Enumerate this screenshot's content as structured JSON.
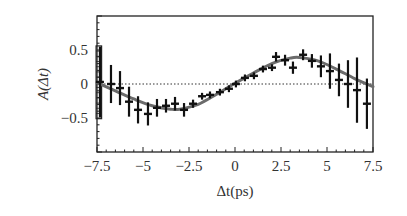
{
  "chart_data": {
    "type": "scatter",
    "title": "",
    "xlabel": "Δt(ps)",
    "ylabel": "A(Δt)",
    "xlim": [
      -7.5,
      7.5
    ],
    "ylim": [
      -1.0,
      1.0
    ],
    "x_ticks": [
      -7.5,
      -5,
      -2.5,
      0,
      2.5,
      5,
      7.5
    ],
    "x_tick_labels": [
      "−7.5",
      "−5",
      "−2.5",
      "0",
      "2.5",
      "5",
      "7.5"
    ],
    "y_ticks": [
      0.5,
      0,
      -0.5
    ],
    "y_tick_labels": [
      "0.5",
      "0",
      "−0.5"
    ],
    "grid": false,
    "legend": null,
    "zero_line": {
      "style": "dotted",
      "y": 0
    },
    "series": [
      {
        "name": "data",
        "style": "points-with-error-bars",
        "x": [
          -7.34,
          -6.74,
          -6.25,
          -5.76,
          -5.27,
          -4.73,
          -4.24,
          -3.75,
          -3.26,
          -2.77,
          -2.28,
          -1.79,
          -1.36,
          -0.82,
          -0.33,
          0.05,
          0.54,
          1.03,
          1.52,
          2.01,
          2.23,
          2.72,
          3.15,
          3.7,
          4.18,
          4.67,
          5.16,
          5.65,
          6.14,
          6.63,
          7.17
        ],
        "y": [
          0.03,
          0.0,
          -0.06,
          -0.26,
          -0.38,
          -0.44,
          -0.35,
          -0.32,
          -0.29,
          -0.38,
          -0.29,
          -0.18,
          -0.16,
          -0.12,
          -0.07,
          0.0,
          0.09,
          0.12,
          0.22,
          0.24,
          0.4,
          0.35,
          0.24,
          0.43,
          0.34,
          0.26,
          0.19,
          0.06,
          0.0,
          -0.09,
          -0.29
        ],
        "yerr": [
          0.52,
          0.28,
          0.25,
          0.22,
          0.2,
          0.17,
          0.13,
          0.1,
          0.1,
          0.1,
          0.06,
          0.05,
          0.05,
          0.05,
          0.05,
          0.05,
          0.05,
          0.05,
          0.05,
          0.05,
          0.07,
          0.08,
          0.09,
          0.08,
          0.1,
          0.16,
          0.26,
          0.24,
          0.35,
          0.48,
          0.37
        ]
      },
      {
        "name": "fit",
        "style": "line",
        "color": "#6b6b6b",
        "x": [
          -7.5,
          -6.5,
          -5.5,
          -4.5,
          -3.5,
          -3.0,
          -2.0,
          -1.0,
          0.0,
          1.0,
          2.0,
          3.0,
          3.5,
          4.5,
          5.5,
          6.5,
          7.5
        ],
        "y": [
          0.02,
          -0.1,
          -0.22,
          -0.32,
          -0.37,
          -0.37,
          -0.3,
          -0.15,
          0.01,
          0.16,
          0.3,
          0.38,
          0.39,
          0.34,
          0.22,
          0.08,
          -0.04
        ]
      }
    ],
    "systematic_box": {
      "x": -7.4,
      "half_width": 0.15,
      "y_low": -0.51,
      "y_high": 0.56
    }
  }
}
